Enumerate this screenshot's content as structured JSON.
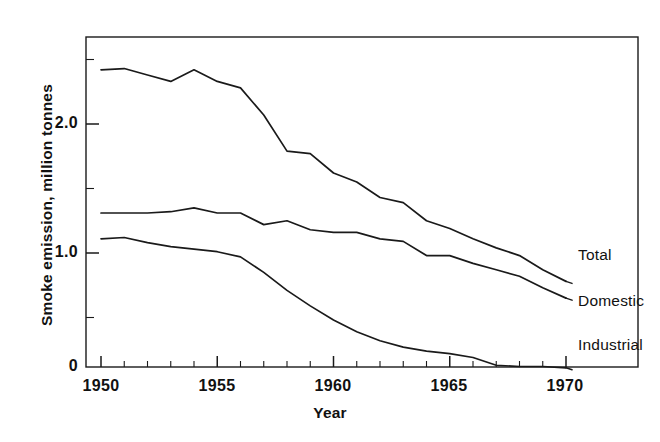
{
  "chart_data": {
    "type": "line",
    "title": "",
    "xlabel": "Year",
    "ylabel": "Smoke emission, million tonnes",
    "xlim": [
      1950,
      1970
    ],
    "ylim": [
      0,
      2.7
    ],
    "xticks": [
      1950,
      1951,
      1952,
      1953,
      1954,
      1955,
      1956,
      1957,
      1958,
      1959,
      1960,
      1961,
      1962,
      1963,
      1964,
      1965,
      1966,
      1967,
      1968,
      1969,
      1970
    ],
    "xtick_labels": [
      "1950",
      "",
      "",
      "",
      "",
      "1955",
      "",
      "",
      "",
      "",
      "1960",
      "",
      "",
      "",
      "",
      "1965",
      "",
      "",
      "",
      "",
      "1970"
    ],
    "xtick_major": [
      1950,
      1955,
      1960,
      1965,
      1970
    ],
    "yticks": [
      0,
      0.5,
      1.0,
      1.5,
      2.0,
      2.5
    ],
    "ytick_labels": [
      "0",
      "",
      "1.0",
      "",
      "2.0",
      ""
    ],
    "grid": false,
    "legend_position": "right-inline-annotations",
    "frame": "box",
    "line_color": "#1a1a1a",
    "x": [
      1950,
      1951,
      1952,
      1953,
      1954,
      1955,
      1956,
      1957,
      1958,
      1959,
      1960,
      1961,
      1962,
      1963,
      1964,
      1965,
      1966,
      1967,
      1968,
      1969,
      1970
    ],
    "series": [
      {
        "name": "Total",
        "label": "Total",
        "values": [
          2.42,
          2.43,
          2.38,
          2.33,
          2.42,
          2.33,
          2.28,
          2.07,
          1.79,
          1.77,
          1.62,
          1.55,
          1.43,
          1.39,
          1.25,
          1.19,
          1.11,
          1.04,
          0.98,
          0.87,
          0.78
        ]
      },
      {
        "name": "Domestic",
        "label": "Domestic",
        "values": [
          1.31,
          1.31,
          1.31,
          1.32,
          1.35,
          1.31,
          1.31,
          1.22,
          1.25,
          1.18,
          1.16,
          1.16,
          1.11,
          1.09,
          0.98,
          0.98,
          0.92,
          0.87,
          0.82,
          0.73,
          0.65
        ]
      },
      {
        "name": "Industrial",
        "label": "Industrial",
        "values": [
          1.11,
          1.12,
          1.08,
          1.05,
          1.03,
          1.01,
          0.97,
          0.85,
          0.71,
          0.59,
          0.48,
          0.39,
          0.32,
          0.27,
          0.24,
          0.22,
          0.19,
          0.13,
          0.12,
          0.12,
          0.11
        ]
      }
    ],
    "annotations": [
      {
        "text": "Total",
        "series": "Total",
        "x": 1970
      },
      {
        "text": "Domestic",
        "series": "Domestic",
        "x": 1970
      },
      {
        "text": "Industrial",
        "series": "Industrial",
        "x": 1970
      }
    ]
  },
  "axis": {
    "ylabel": "Smoke emission, million tonnes",
    "xlabel": "Year",
    "ytick_0": "0",
    "ytick_1": "1.0",
    "ytick_2": "2.0",
    "xtick_1950": "1950",
    "xtick_1955": "1955",
    "xtick_1960": "1960",
    "xtick_1965": "1965",
    "xtick_1970": "1970"
  },
  "labels": {
    "total": "Total",
    "domestic": "Domestic",
    "industrial": "Industrial"
  }
}
